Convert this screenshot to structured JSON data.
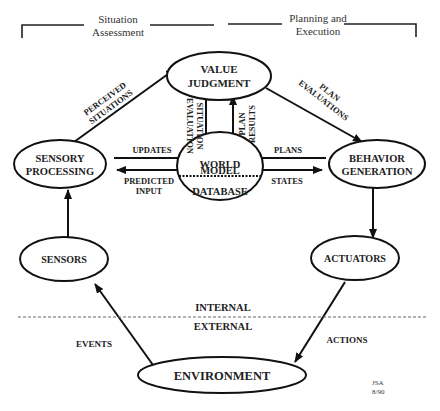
{
  "header": {
    "left": [
      "Situation",
      "Assessment"
    ],
    "right": [
      "Planning and",
      "Execution"
    ]
  },
  "nodes": {
    "value_judgment": [
      "VALUE",
      "JUDGMENT"
    ],
    "sensory_processing": [
      "SENSORY",
      "PROCESSING"
    ],
    "world_model": [
      "WORLD",
      "MODEL"
    ],
    "database": "DATABASE",
    "behavior_generation": [
      "BEHAVIOR",
      "GENERATION"
    ],
    "sensors": "SENSORS",
    "actuators": "ACTUATORS",
    "environment": "ENVIRONMENT"
  },
  "edges": {
    "perceived_situations": [
      "PERCEIVED",
      "SITUATIONS"
    ],
    "situation_evaluation": [
      "SITUATION",
      "EVALUATION"
    ],
    "plan_results": [
      "PLAN",
      "RESULTS"
    ],
    "plan_evaluations": [
      "PLAN",
      "EVALUATIONS"
    ],
    "updates": "UPDATES",
    "predicted_input": [
      "PREDICTED",
      "INPUT"
    ],
    "plans": "PLANS",
    "states": "STATES",
    "events": "EVENTS",
    "actions": "ACTIONS"
  },
  "boundary": {
    "internal": "INTERNAL",
    "external": "EXTERNAL"
  },
  "signature": [
    "JSA",
    "8/90"
  ]
}
